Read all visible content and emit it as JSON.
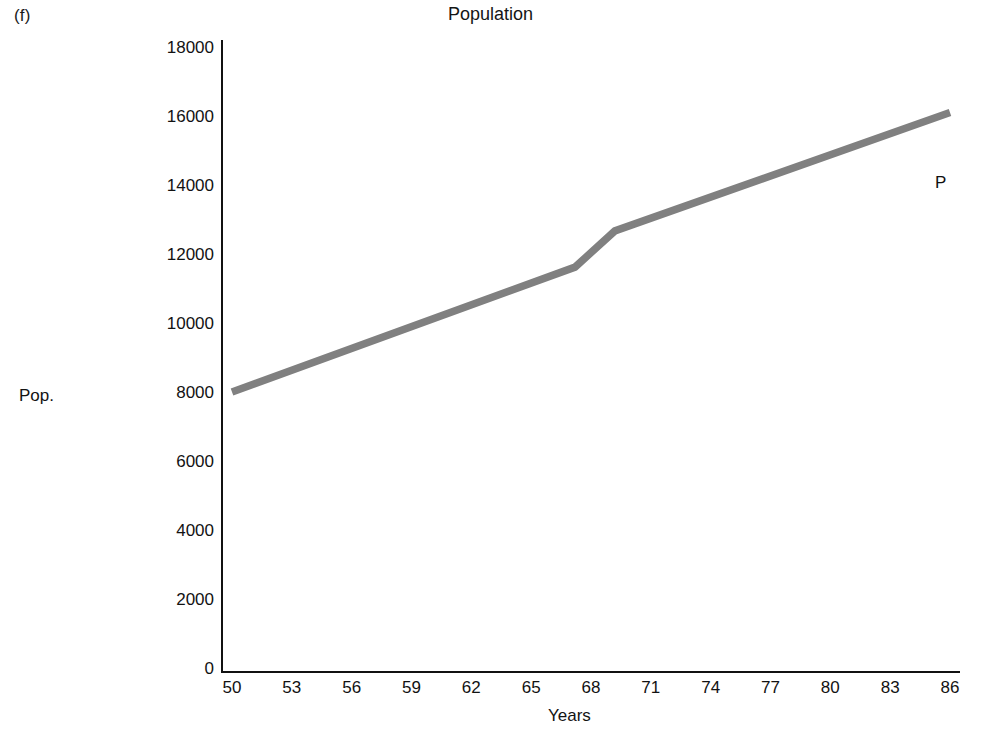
{
  "figure": {
    "panel_label": "(f)",
    "title": "Population",
    "series_annotation": "P"
  },
  "chart_data": {
    "type": "line",
    "title": "Population",
    "xlabel": "Years",
    "ylabel": "Pop.",
    "xlim": [
      50,
      86
    ],
    "ylim": [
      0,
      18000
    ],
    "grid": false,
    "legend": null,
    "annotations": [
      {
        "text": "P",
        "x": 86,
        "y": 14450
      },
      {
        "text": "(f)",
        "x": null,
        "y": null
      }
    ],
    "x_ticks": [
      50,
      53,
      56,
      59,
      62,
      65,
      68,
      71,
      74,
      77,
      80,
      83,
      86
    ],
    "x_tick_labels": [
      "50",
      "53",
      "56",
      "59",
      "62",
      "65",
      "68",
      "71",
      "74",
      "77",
      "80",
      "83",
      "86"
    ],
    "y_ticks": [
      0,
      2000,
      4000,
      6000,
      8000,
      10000,
      12000,
      14000,
      16000,
      18000
    ],
    "y_tick_labels": [
      "0",
      "2000",
      "4000",
      "6000",
      "8000",
      "10000",
      "12000",
      "14000",
      "16000",
      "18000"
    ],
    "series": [
      {
        "name": "P",
        "color": "#808080",
        "x": [
          50,
          67.2,
          69.2,
          86
        ],
        "values": [
          8000,
          11620,
          12670,
          16100
        ]
      }
    ]
  },
  "style": {
    "line_color": "#808080",
    "axis_color": "#111111",
    "text_color": "#121212",
    "background": "#ffffff"
  }
}
